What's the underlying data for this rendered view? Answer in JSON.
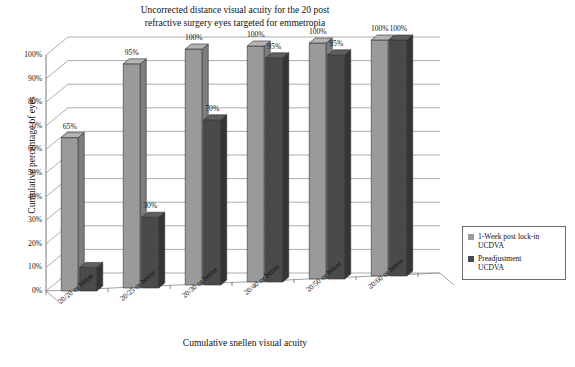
{
  "chart_data": {
    "type": "bar",
    "title": "Uncorrected distance visual acuity for the 20 post refractive surgery eyes targeted for emmetropia",
    "title_line1": "Uncorrected distance visual acuity for the 20 post",
    "title_line2": "refractive surgery eyes targeted for emmetropia",
    "xlabel": "Cumulative snellen visual acuity",
    "ylabel": "Cumulative percentage of eyes",
    "categories": [
      "20/20 or better",
      "20/25 or better",
      "20/30 or better",
      "20/40 or better",
      "20/50 or better",
      "20/60 or better"
    ],
    "ylim": [
      0,
      100
    ],
    "yticks": [
      "0%",
      "10%",
      "20%",
      "30%",
      "40%",
      "50%",
      "60%",
      "70%",
      "80%",
      "90%",
      "100%"
    ],
    "ytick_values": [
      0,
      10,
      20,
      30,
      40,
      50,
      60,
      70,
      80,
      90,
      100
    ],
    "grid": true,
    "legend_position": "right",
    "style": "3d-column",
    "series": [
      {
        "name": "1-Week post lock-in UCDVA",
        "name_line1": "1-Week post lock-in",
        "name_line2": "UCDVA",
        "color": "#9a9a9a",
        "side_color": "#7d7d7d",
        "top_color": "#b4b4b4",
        "values": [
          65,
          95,
          100,
          100,
          100,
          100
        ],
        "labels": [
          "65%",
          "95%",
          "100%",
          "100%",
          "100%",
          "100%"
        ]
      },
      {
        "name": "Preadjustment UCDVA",
        "name_line1": "Preadjustment",
        "name_line2": "UCDVA",
        "color": "#4a4a4a",
        "side_color": "#353535",
        "top_color": "#5e5e5e",
        "values": [
          10,
          30,
          70,
          95,
          95,
          100
        ],
        "labels": [
          "",
          "30%",
          "70%",
          "95%",
          "95%",
          "100%"
        ]
      }
    ]
  }
}
